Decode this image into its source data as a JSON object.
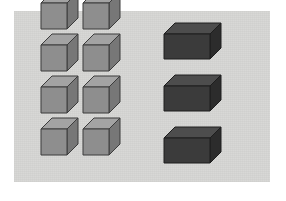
{
  "figure": {
    "canvas": {
      "width": 286,
      "height": 201,
      "background": "#ffffff"
    },
    "panel": {
      "x": 14,
      "y": 11,
      "width": 256,
      "height": 171,
      "fill": "#d7d7d5",
      "name": "illustration-panel"
    },
    "colors": {
      "panel_background": "#d7d7d5",
      "page_background": "#ffffff",
      "cube_front": "#8e8e8e",
      "cube_top": "#a3a3a3",
      "cube_side": "#777777",
      "cube_outline": "#3c3c3c",
      "block_front": "#3b3b3b",
      "block_top": "#4d4d4d",
      "block_side": "#2c2c2c",
      "block_outline": "#1e1e1e"
    },
    "projection": {
      "type": "oblique",
      "depth_dx": 11,
      "depth_dy": -11
    },
    "groups": [
      {
        "id": "small-cubes",
        "label": "Small cubes",
        "count": 8,
        "rows": 4,
        "columns": 2,
        "shape": "cube",
        "front_width": 26,
        "front_height": 26,
        "fill_front": "#8e8e8e",
        "fill_top": "#a3a3a3",
        "fill_side": "#777777",
        "outline": "#3c3c3c",
        "items": [
          {
            "id": "cube-1",
            "row": 1,
            "col": 1,
            "x": 41,
            "y": 29
          },
          {
            "id": "cube-2",
            "row": 1,
            "col": 2,
            "x": 83,
            "y": 29
          },
          {
            "id": "cube-3",
            "row": 2,
            "col": 1,
            "x": 41,
            "y": 71
          },
          {
            "id": "cube-4",
            "row": 2,
            "col": 2,
            "x": 83,
            "y": 71
          },
          {
            "id": "cube-5",
            "row": 3,
            "col": 1,
            "x": 41,
            "y": 113
          },
          {
            "id": "cube-6",
            "row": 3,
            "col": 2,
            "x": 83,
            "y": 113
          },
          {
            "id": "cube-7",
            "row": 4,
            "col": 1,
            "x": 41,
            "y": 155
          },
          {
            "id": "cube-8",
            "row": 4,
            "col": 2,
            "x": 83,
            "y": 155
          }
        ]
      },
      {
        "id": "large-blocks",
        "label": "Large rectangular blocks",
        "count": 3,
        "rows": 3,
        "columns": 1,
        "shape": "cuboid",
        "front_width": 46,
        "front_height": 25,
        "fill_front": "#3b3b3b",
        "fill_top": "#4d4d4d",
        "fill_side": "#2c2c2c",
        "outline": "#1e1e1e",
        "items": [
          {
            "id": "block-1",
            "row": 1,
            "col": 1,
            "x": 164,
            "y": 59
          },
          {
            "id": "block-2",
            "row": 2,
            "col": 1,
            "x": 164,
            "y": 111
          },
          {
            "id": "block-3",
            "row": 3,
            "col": 1,
            "x": 164,
            "y": 163
          }
        ]
      }
    ]
  }
}
